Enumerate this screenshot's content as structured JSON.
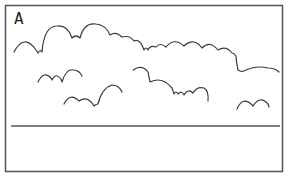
{
  "figure": {
    "panel_label": "A",
    "stroke_color": "#3a3a3a",
    "frame_color": "#555555",
    "background": "#ffffff",
    "elements": [
      {
        "name": "cloud-outline-top",
        "description": "long scalloped cloud outline across top"
      },
      {
        "name": "cloud-outline-small-left",
        "description": "small scalloped cloud, left middle"
      },
      {
        "name": "cloud-outline-lower-left",
        "description": "scalloped cloud, lower left"
      },
      {
        "name": "cloud-outline-middle",
        "description": "scalloped cloud, center"
      },
      {
        "name": "cloud-outline-right",
        "description": "double-bump cloud, lower right"
      },
      {
        "name": "horizon-line",
        "description": "horizontal ground line"
      }
    ]
  }
}
